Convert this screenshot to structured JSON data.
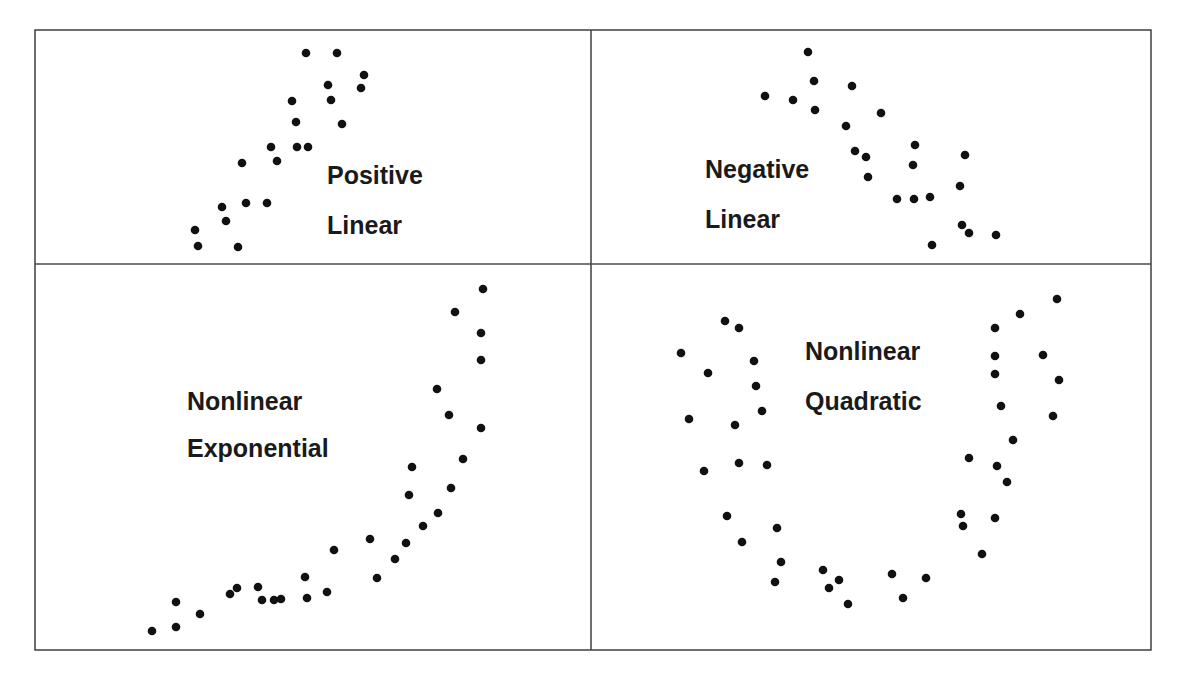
{
  "figure": {
    "colors": {
      "dot": "#111111",
      "frame": "#4a4a4a",
      "text": "#1a1a1a",
      "background": "#ffffff"
    }
  },
  "chart_data": [
    {
      "type": "scatter",
      "title": "Positive Linear",
      "label_lines": [
        "Positive",
        "Linear"
      ],
      "xlabel": "",
      "ylabel": "",
      "grid": false,
      "points_px": [
        [
          306,
          53
        ],
        [
          337,
          53
        ],
        [
          364,
          75
        ],
        [
          328,
          85
        ],
        [
          361,
          88
        ],
        [
          292,
          101
        ],
        [
          331,
          100
        ],
        [
          296,
          122
        ],
        [
          342,
          124
        ],
        [
          297,
          147
        ],
        [
          308,
          147
        ],
        [
          271,
          147
        ],
        [
          277,
          161
        ],
        [
          242,
          163
        ],
        [
          222,
          207
        ],
        [
          246,
          203
        ],
        [
          267,
          203
        ],
        [
          226,
          221
        ],
        [
          195,
          230
        ],
        [
          198,
          246
        ],
        [
          238,
          247
        ]
      ]
    },
    {
      "type": "scatter",
      "title": "Negative Linear",
      "label_lines": [
        "Negative",
        "Linear"
      ],
      "xlabel": "",
      "ylabel": "",
      "grid": false,
      "points_px": [
        [
          808,
          52
        ],
        [
          814,
          81
        ],
        [
          852,
          86
        ],
        [
          765,
          96
        ],
        [
          793,
          100
        ],
        [
          815,
          110
        ],
        [
          881,
          113
        ],
        [
          846,
          126
        ],
        [
          915,
          145
        ],
        [
          855,
          151
        ],
        [
          866,
          157
        ],
        [
          965,
          155
        ],
        [
          913,
          165
        ],
        [
          868,
          177
        ],
        [
          960,
          186
        ],
        [
          897,
          199
        ],
        [
          914,
          199
        ],
        [
          930,
          197
        ],
        [
          962,
          225
        ],
        [
          969,
          233
        ],
        [
          996,
          235
        ],
        [
          932,
          245
        ]
      ]
    },
    {
      "type": "scatter",
      "title": "Nonlinear Exponential",
      "label_lines": [
        "Nonlinear",
        "Exponential"
      ],
      "xlabel": "",
      "ylabel": "",
      "grid": false,
      "points_px": [
        [
          483,
          289
        ],
        [
          455,
          312
        ],
        [
          481,
          333
        ],
        [
          481,
          360
        ],
        [
          437,
          389
        ],
        [
          449,
          415
        ],
        [
          481,
          428
        ],
        [
          463,
          459
        ],
        [
          412,
          467
        ],
        [
          409,
          495
        ],
        [
          451,
          488
        ],
        [
          438,
          513
        ],
        [
          423,
          526
        ],
        [
          406,
          543
        ],
        [
          395,
          559
        ],
        [
          370,
          539
        ],
        [
          334,
          550
        ],
        [
          377,
          578
        ],
        [
          327,
          592
        ],
        [
          305,
          577
        ],
        [
          307,
          598
        ],
        [
          281,
          599
        ],
        [
          274,
          600
        ],
        [
          258,
          587
        ],
        [
          262,
          600
        ],
        [
          237,
          588
        ],
        [
          230,
          594
        ],
        [
          200,
          614
        ],
        [
          176,
          602
        ],
        [
          176,
          627
        ],
        [
          152,
          631
        ]
      ]
    },
    {
      "type": "scatter",
      "title": "Nonlinear Quadratic",
      "label_lines": [
        "Nonlinear",
        "Quadratic"
      ],
      "xlabel": "",
      "ylabel": "",
      "grid": false,
      "points_px": [
        [
          725,
          321
        ],
        [
          739,
          328
        ],
        [
          681,
          353
        ],
        [
          754,
          361
        ],
        [
          708,
          373
        ],
        [
          756,
          386
        ],
        [
          689,
          419
        ],
        [
          762,
          411
        ],
        [
          735,
          425
        ],
        [
          739,
          463
        ],
        [
          704,
          471
        ],
        [
          767,
          465
        ],
        [
          727,
          516
        ],
        [
          777,
          528
        ],
        [
          742,
          542
        ],
        [
          781,
          562
        ],
        [
          775,
          582
        ],
        [
          823,
          570
        ],
        [
          839,
          580
        ],
        [
          829,
          588
        ],
        [
          848,
          604
        ],
        [
          892,
          574
        ],
        [
          926,
          578
        ],
        [
          903,
          598
        ],
        [
          1057,
          299
        ],
        [
          1020,
          314
        ],
        [
          995,
          328
        ],
        [
          995,
          356
        ],
        [
          1043,
          355
        ],
        [
          995,
          374
        ],
        [
          1059,
          380
        ],
        [
          1001,
          406
        ],
        [
          1053,
          416
        ],
        [
          1013,
          440
        ],
        [
          969,
          458
        ],
        [
          997,
          466
        ],
        [
          1007,
          482
        ],
        [
          961,
          514
        ],
        [
          963,
          526
        ],
        [
          995,
          518
        ],
        [
          982,
          554
        ]
      ]
    }
  ],
  "panels": [
    {
      "label_line1": "Positive",
      "label_line2": "Linear",
      "label_x": 327,
      "label_y1": 184,
      "label_y2": 234
    },
    {
      "label_line1": "Negative",
      "label_line2": "Linear",
      "label_x": 705,
      "label_y1": 178,
      "label_y2": 228
    },
    {
      "label_line1": "Nonlinear",
      "label_line2": "Exponential",
      "label_x": 187,
      "label_y1": 410,
      "label_y2": 457
    },
    {
      "label_line1": "Nonlinear",
      "label_line2": "Quadratic",
      "label_x": 805,
      "label_y1": 360,
      "label_y2": 410
    }
  ],
  "layout": {
    "frame": {
      "left": 35,
      "top": 30,
      "right": 1151,
      "bottom": 650
    },
    "divider_x": 591,
    "divider_y": 264,
    "dot_radius": 4.3
  }
}
